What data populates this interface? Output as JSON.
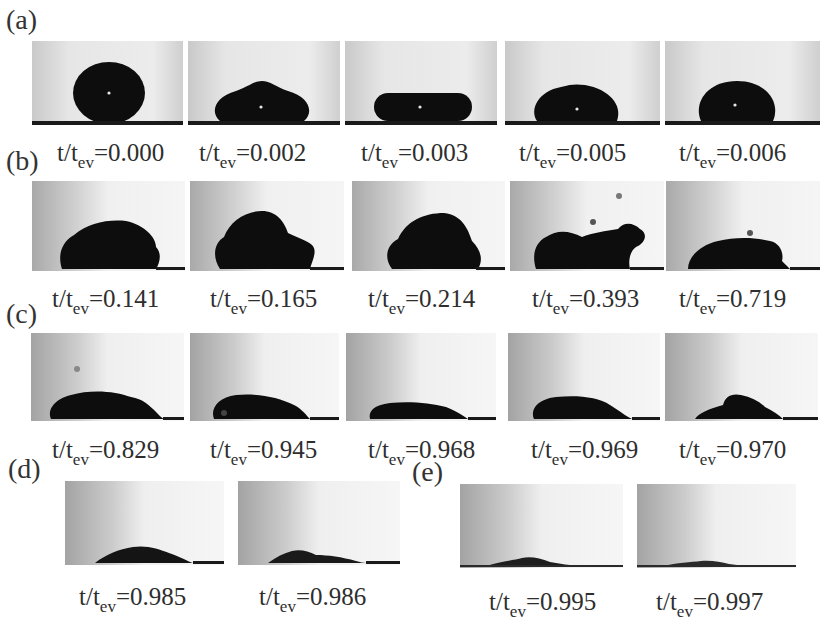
{
  "figure": {
    "variable_label": {
      "prefix": "t/t",
      "subscript": "ev",
      "equals": "="
    },
    "colors": {
      "droplet": "#0d0d0d",
      "background_light": "#f2f2f2",
      "background_dark": "#a8a8a8",
      "substrate": "#1a1a1a",
      "label_text": "#2e2e2e"
    },
    "panels": [
      {
        "label": "(a)",
        "frames": [
          {
            "value": "0.000",
            "shape": "sphere"
          },
          {
            "value": "0.002",
            "shape": "flattened-dome"
          },
          {
            "value": "0.003",
            "shape": "pancake"
          },
          {
            "value": "0.005",
            "shape": "dome"
          },
          {
            "value": "0.006",
            "shape": "tall-dome"
          }
        ]
      },
      {
        "label": "(b)",
        "frames": [
          {
            "value": "0.141",
            "shape": "irregular-mound"
          },
          {
            "value": "0.165",
            "shape": "irregular-mound-lobed"
          },
          {
            "value": "0.214",
            "shape": "irregular-mound"
          },
          {
            "value": "0.393",
            "shape": "elongated-mound"
          },
          {
            "value": "0.719",
            "shape": "rounded-mound"
          }
        ]
      },
      {
        "label": "(c)",
        "frames": [
          {
            "value": "0.829",
            "shape": "low-mound"
          },
          {
            "value": "0.945",
            "shape": "low-mound"
          },
          {
            "value": "0.968",
            "shape": "thin-film"
          },
          {
            "value": "0.969",
            "shape": "low-mound"
          },
          {
            "value": "0.970",
            "shape": "low-peaked"
          }
        ]
      },
      {
        "label": "(d)",
        "frames": [
          {
            "value": "0.985",
            "shape": "thin-residue"
          },
          {
            "value": "0.986",
            "shape": "thin-residue"
          }
        ]
      },
      {
        "label": "(e)",
        "frames": [
          {
            "value": "0.995",
            "shape": "trace-residue"
          },
          {
            "value": "0.997",
            "shape": "trace-residue"
          }
        ]
      }
    ]
  }
}
